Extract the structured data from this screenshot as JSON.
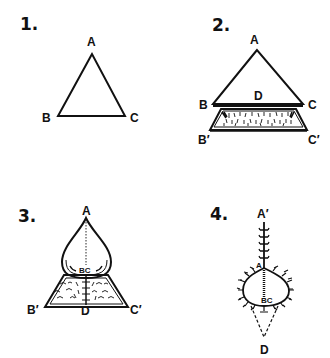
{
  "diagram": {
    "type": "surgical flap closure steps",
    "stroke_color": "#111111",
    "background": "#ffffff",
    "panels": [
      {
        "number": "1.",
        "labels": {
          "apex": "A",
          "left": "B",
          "right": "C"
        },
        "description": "Triangle ABC"
      },
      {
        "number": "2.",
        "labels": {
          "apex": "A",
          "center": "D",
          "left": "B",
          "right": "C",
          "lower_left": "B′",
          "lower_right": "C′"
        },
        "description": "Triangle advanced with undermined trapezoid region below BC"
      },
      {
        "number": "3.",
        "labels": {
          "apex": "A",
          "center": "BC",
          "left": "B′",
          "bottom": "D",
          "right": "C′"
        },
        "description": "Teardrop flap over trapezoid, sutured midline"
      },
      {
        "number": "4.",
        "labels": {
          "top": "A′",
          "apex": "A",
          "center": "BC",
          "bottom": "D"
        },
        "description": "Closed suture line with dashed triangle to D"
      }
    ]
  }
}
